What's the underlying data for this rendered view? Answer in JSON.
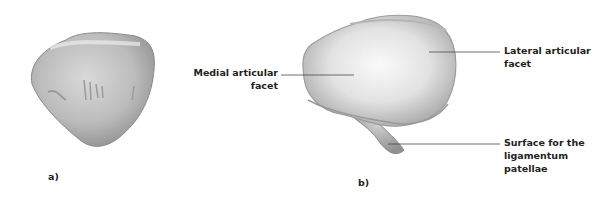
{
  "figure": {
    "panels": [
      {
        "id": "a",
        "label": "a)"
      },
      {
        "id": "b",
        "label": "b)"
      }
    ],
    "annotations": {
      "medial_line1": "Medial articular",
      "medial_line2": "facet",
      "lateral_line1": "Lateral articular",
      "lateral_line2": "facet",
      "surface_line1": "Surface for the",
      "surface_line2": "ligamentum",
      "surface_line3": "patellae"
    },
    "colors": {
      "bone_light": "#f4f4f4",
      "bone_mid": "#c8c8c8",
      "bone_dark": "#8e8e8e",
      "leader_line": "#4a4a4a",
      "text": "#231f20"
    }
  }
}
